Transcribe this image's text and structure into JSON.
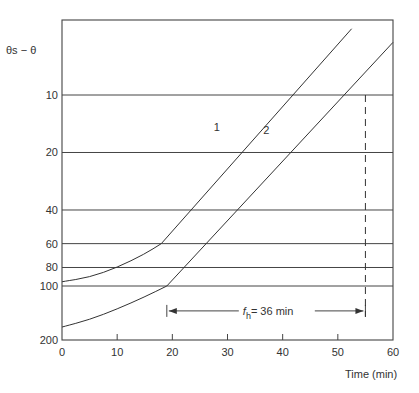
{
  "chart_data": {
    "type": "line",
    "title": "",
    "ylabel": "θs − θ",
    "xlabel": "Time (min)",
    "yscale": "log",
    "ylim_top": 4,
    "ylim_bottom": 200,
    "xlim": [
      0,
      60
    ],
    "y_inverted": true,
    "x_ticks": [
      0,
      10,
      20,
      30,
      40,
      50,
      60
    ],
    "y_ticks": [
      10,
      20,
      40,
      60,
      80,
      100,
      200
    ],
    "grid": "horizontal lines at y ticks",
    "series": [
      {
        "name": "1",
        "points": [
          [
            0,
            95
          ],
          [
            5,
            90
          ],
          [
            10,
            80
          ],
          [
            15,
            68
          ],
          [
            18,
            60
          ],
          [
            52.5,
            4.5
          ]
        ]
      },
      {
        "name": "2",
        "points": [
          [
            0,
            164
          ],
          [
            5,
            150
          ],
          [
            10,
            132
          ],
          [
            15,
            114
          ],
          [
            19,
            100
          ],
          [
            60,
            5.3
          ]
        ]
      }
    ],
    "annotations": [
      {
        "text": "fh = 36 min",
        "main": "f",
        "sub": "h",
        "rest": "= 36 min",
        "from_x": 19,
        "to_x": 55,
        "at_y": 135
      },
      {
        "text": "dashed vertical line",
        "x": 55,
        "from_y": 10,
        "to_y": 135
      }
    ]
  }
}
